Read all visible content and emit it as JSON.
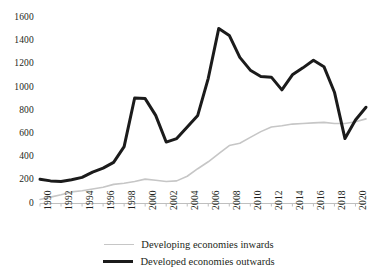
{
  "chart_data": {
    "type": "line",
    "title": "",
    "subtitle": "",
    "xlabel": "",
    "ylabel": "",
    "x": [
      1990,
      1991,
      1992,
      1993,
      1994,
      1995,
      1996,
      1997,
      1998,
      1999,
      2000,
      2001,
      2002,
      2003,
      2004,
      2005,
      2006,
      2007,
      2008,
      2009,
      2010,
      2011,
      2012,
      2013,
      2014,
      2015,
      2016,
      2017,
      2018,
      2019,
      2020,
      2021
    ],
    "xlim": [
      1990,
      2021
    ],
    "ylim": [
      0,
      1600
    ],
    "yticks": [
      0,
      200,
      400,
      600,
      800,
      1000,
      1200,
      1400,
      1600
    ],
    "xticks": [
      1990,
      1992,
      1994,
      1996,
      1998,
      2000,
      2002,
      2004,
      2006,
      2008,
      2010,
      2012,
      2014,
      2016,
      2018,
      2020
    ],
    "xtick_labels": [
      "1990",
      "1992",
      "1994",
      "1996",
      "1998",
      "2000",
      "2002",
      "2004",
      "2006",
      "2008",
      "2010",
      "2012",
      "2014",
      "2016",
      "2018",
      "2020"
    ],
    "ytick_labels": [
      "0",
      "200",
      "400",
      "600",
      "800",
      "1000",
      "1200",
      "1400",
      "1600"
    ],
    "grid": false,
    "legend_position": "bottom",
    "series": [
      {
        "name": "Developing economies inwards",
        "color": "#c6c6c6",
        "width": 1.6,
        "values": [
          35,
          55,
          75,
          100,
          110,
          125,
          140,
          165,
          175,
          190,
          210,
          200,
          190,
          195,
          235,
          300,
          360,
          430,
          500,
          520,
          570,
          620,
          660,
          670,
          685,
          690,
          695,
          700,
          690,
          690,
          705,
          730
        ]
      },
      {
        "name": "Developed economies outwards",
        "color": "#1b1b1b",
        "width": 3,
        "values": [
          210,
          195,
          190,
          205,
          225,
          270,
          305,
          355,
          490,
          910,
          905,
          760,
          530,
          560,
          660,
          760,
          1080,
          1510,
          1450,
          1260,
          1150,
          1095,
          1090,
          980,
          1110,
          1170,
          1235,
          1180,
          960,
          560,
          720,
          830
        ]
      }
    ]
  },
  "legend": {
    "items": [
      {
        "label": "Developing economies inwards",
        "style": "gray-thin"
      },
      {
        "label": "Developed economies outwards",
        "style": "black-thick"
      }
    ]
  },
  "axes": {
    "y_axis_name": "value-axis",
    "x_axis_name": "year-axis"
  }
}
